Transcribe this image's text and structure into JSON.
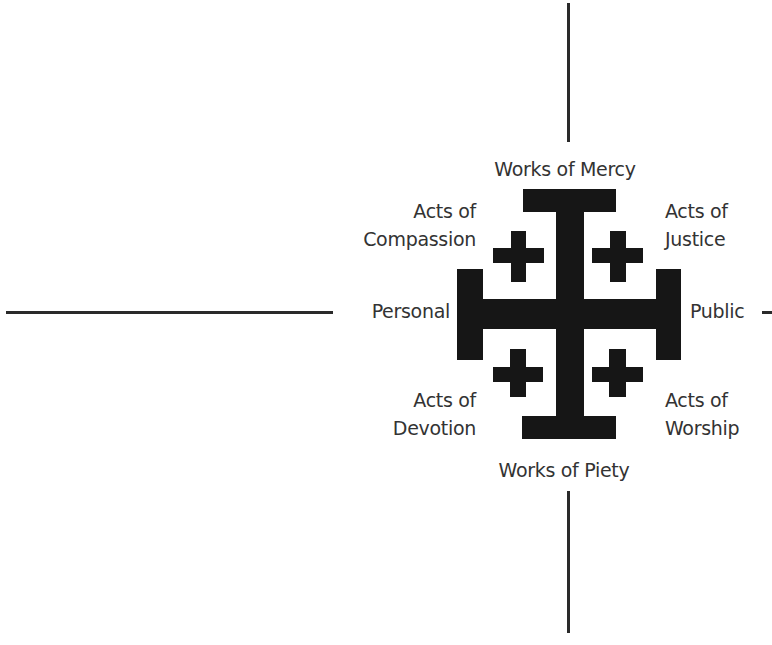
{
  "diagram": {
    "type": "cross-quadrant",
    "colors": {
      "symbol": "#161616",
      "axis_lines": "#2a2a2a",
      "text": "#333333",
      "background": "#ffffff"
    },
    "axes": {
      "top": "Works of Mercy",
      "bottom": "Works of Piety",
      "left": "Personal",
      "right": "Public"
    },
    "quadrants": {
      "top_left": {
        "line1": "Acts of",
        "line2": "Compassion"
      },
      "top_right": {
        "line1": "Acts of",
        "line2": "Justice"
      },
      "bottom_left": {
        "line1": "Acts of",
        "line2": "Devotion"
      },
      "bottom_right": {
        "line1": "Acts of",
        "line2": "Worship"
      }
    },
    "center_symbol": "jerusalem-cross"
  }
}
